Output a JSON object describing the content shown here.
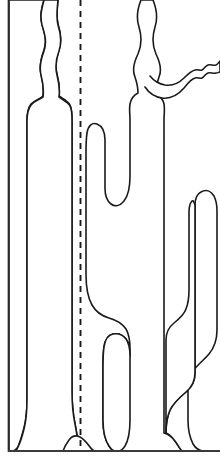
{
  "figure": {
    "subject": "cacti",
    "background_color": "#ffffff",
    "line_color": "#1a1a1a",
    "fill_color": "#ffffff",
    "canvas_width": 220,
    "canvas_height": 468
  },
  "annotations": {
    "frame_label": "left frame line",
    "ground_label": "ground line",
    "axis_label": "vertical dashed reference line"
  },
  "chart_data": {
    "type": "line",
    "xlabel": "",
    "ylabel": "",
    "grid": false,
    "legend": "none",
    "xlim": [
      0,
      220
    ],
    "ylim": [
      0,
      468
    ],
    "elements": [
      {
        "name": "left-frame-line",
        "kind": "straight-line",
        "x": 8,
        "y_top": 0,
        "y_bottom": 451
      },
      {
        "name": "ground-line",
        "kind": "straight-line",
        "y": 451,
        "x_left": 8,
        "x_right": 220
      },
      {
        "name": "dashed-reference-line",
        "kind": "dashed-vertical",
        "x": 80,
        "y_top": 0,
        "y_bottom": 451,
        "dash": "6 5"
      },
      {
        "name": "left-cactus",
        "kind": "outline",
        "trunk_left": 27,
        "trunk_right": 72,
        "trunk_top": 104,
        "base_y": 451,
        "stem_top": 0,
        "arms": 0
      },
      {
        "name": "middle-cactus",
        "kind": "outline",
        "trunk_left": 130,
        "trunk_right": 165,
        "trunk_top": 98,
        "base_y": 451,
        "stem_top": 0,
        "arms": 2
      },
      {
        "name": "right-cactus",
        "kind": "outline",
        "trunk_left": 165,
        "trunk_right": 220,
        "arm_top": 190,
        "base_y": 451,
        "arms": 1
      }
    ]
  }
}
